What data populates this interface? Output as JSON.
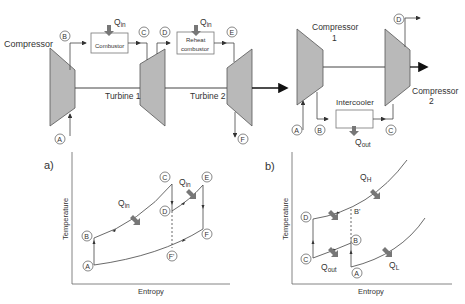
{
  "top_left": {
    "compressor_label": "Compressor",
    "turbine1_label": "Turbine 1",
    "turbine2_label": "Turbine 2",
    "combustor_label": "Combustor",
    "reheat_label_line1": "Reheat",
    "reheat_label_line2": "combustor",
    "qin_main": "Q",
    "qin_sub": "in",
    "states": [
      "A",
      "B",
      "C",
      "D",
      "E",
      "F"
    ]
  },
  "top_right": {
    "compressor1_line1": "Compressor",
    "compressor1_line2": "1",
    "compressor2_line1": "Compressor",
    "compressor2_line2": "2",
    "intercooler_label": "Intercooler",
    "qout_main": "Q",
    "qout_sub": "out",
    "states": [
      "A",
      "B",
      "C",
      "D"
    ]
  },
  "plot_a": {
    "panel_label": "a)",
    "xlabel": "Entropy",
    "ylabel": "Temperature",
    "qin_main": "Q",
    "qin_sub": "in",
    "states": [
      "A",
      "B",
      "C",
      "D",
      "E",
      "F",
      "F'"
    ]
  },
  "plot_b": {
    "panel_label": "b)",
    "xlabel": "Entropy",
    "ylabel": "Temperature",
    "qh_main": "Q",
    "qh_sub": "H",
    "ql_main": "Q",
    "ql_sub": "L",
    "qout_main": "Q",
    "qout_sub": "out",
    "bprime": "B'",
    "states": [
      "A",
      "B",
      "C",
      "D"
    ]
  },
  "colors": {
    "machine_fill": "#b9b9b9",
    "line": "#444444",
    "arrow": "#8a8a8a",
    "box_stroke": "#777777"
  }
}
